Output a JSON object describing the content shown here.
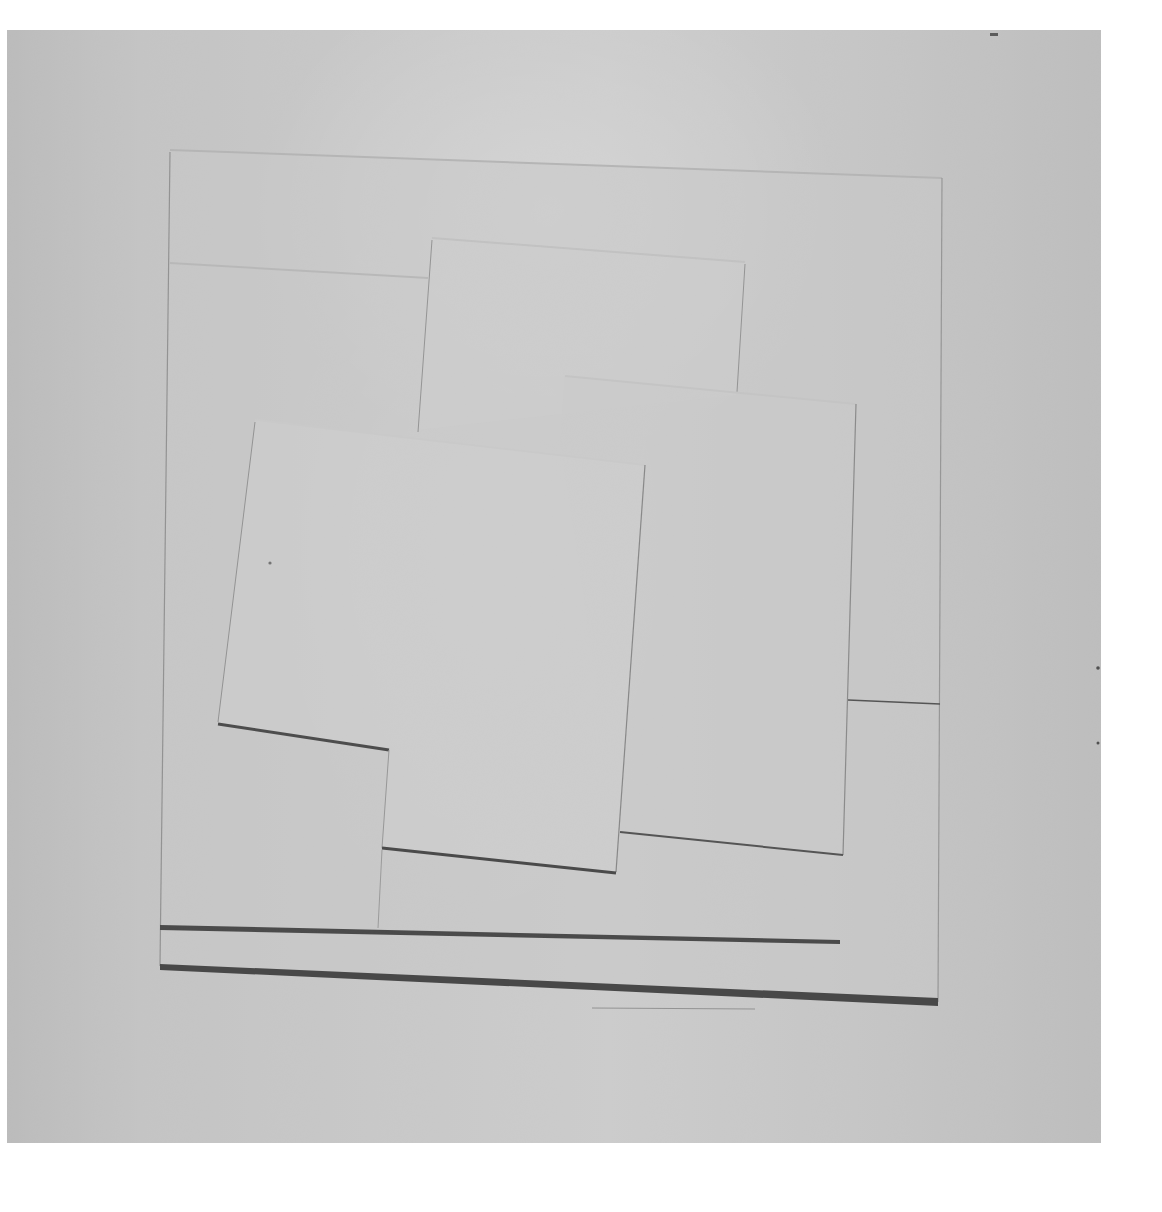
{
  "image": {
    "subject": "white relief artwork photograph",
    "description": "Monochrome photograph of a white geometric relief: overlapping tilted rectangular panels on a square base, with two dark shadow lines along the bottom edges",
    "colors": {
      "page_background": "#ffffff",
      "photo_background": "#e6e6e6",
      "panel_light": "#f3f3f3",
      "edge_line": "#8a8a8a",
      "shadow_line": "#2a2a2a"
    }
  },
  "caption": {
    "part1": "",
    "part2": ""
  }
}
